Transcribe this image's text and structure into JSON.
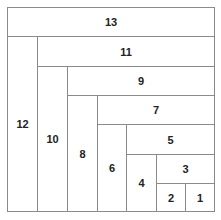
{
  "diagram": {
    "type": "nested-rectangle-spiral",
    "cells": [
      {
        "label": "13",
        "orientation": "horizontal"
      },
      {
        "label": "12",
        "orientation": "vertical"
      },
      {
        "label": "11",
        "orientation": "horizontal"
      },
      {
        "label": "10",
        "orientation": "vertical"
      },
      {
        "label": "9",
        "orientation": "horizontal"
      },
      {
        "label": "8",
        "orientation": "vertical"
      },
      {
        "label": "7",
        "orientation": "horizontal"
      },
      {
        "label": "6",
        "orientation": "vertical"
      },
      {
        "label": "5",
        "orientation": "horizontal"
      },
      {
        "label": "4",
        "orientation": "vertical"
      },
      {
        "label": "3",
        "orientation": "horizontal"
      },
      {
        "label": "2",
        "orientation": "square"
      },
      {
        "label": "1",
        "orientation": "square"
      }
    ],
    "line_color": "#8a8a8a",
    "text_color": "#222222"
  }
}
